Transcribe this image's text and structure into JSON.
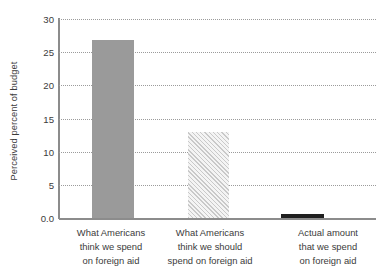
{
  "chart_data": {
    "type": "bar",
    "title": "",
    "xlabel": "",
    "ylabel": "Perceived percent of budget",
    "ylim": [
      0,
      30
    ],
    "grid": true,
    "legend": "none",
    "categories": [
      "What Americans think we spend on foreign aid",
      "What Americans think we should spend on foreign aid",
      "Actual amount that we spend on foreign aid"
    ],
    "category_lines": [
      [
        "What Americans",
        "think we spend",
        "on foreign aid"
      ],
      [
        "What Americans",
        "think we should",
        "spend on foreign aid"
      ],
      [
        "Actual amount",
        "that we spend",
        "on foreign aid"
      ]
    ],
    "values": [
      26.9,
      13.0,
      0.6
    ],
    "bar_styles": [
      "solid-gray",
      "diagonal-hatch",
      "solid-dark"
    ],
    "ytick_labels": [
      "0.0",
      "5",
      "10",
      "15",
      "20",
      "25",
      "30"
    ],
    "ytick_values": [
      0,
      5,
      10,
      15,
      20,
      25,
      30
    ]
  },
  "colors": {
    "bar_solid": "#9a9a9a",
    "bar_hatch_line": "#c9c9c9",
    "bar_hatch_bg": "#f4f4f4",
    "bar_dark": "#1f1f1f",
    "axis": "#8c8c8c",
    "grid": "#9b9b9b",
    "text": "#3b3b3b",
    "background": "#ffffff"
  }
}
